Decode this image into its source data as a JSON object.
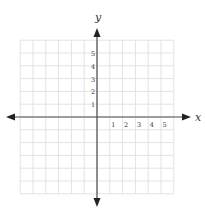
{
  "chart_data": {
    "type": "scatter",
    "title": "",
    "xlabel": "x",
    "ylabel": "y",
    "x_ticks": [
      "1",
      "2",
      "3",
      "4",
      "5"
    ],
    "y_ticks": [
      "1",
      "2",
      "3",
      "4",
      "5"
    ],
    "xlim": [
      -6,
      6
    ],
    "ylim": [
      -6,
      6
    ],
    "grid": true,
    "series": [],
    "legend": null
  },
  "labels": {
    "x_axis": "x",
    "y_axis": "y"
  },
  "colors": {
    "grid": "#e3e3e3",
    "axis": "#4a4a4a",
    "arrow": "#222222",
    "text": "#333333"
  }
}
